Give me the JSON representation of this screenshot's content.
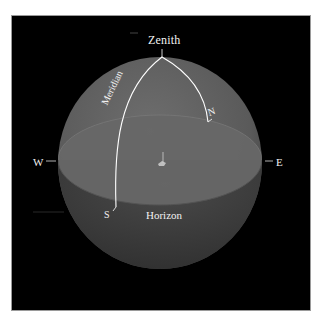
{
  "diagram": {
    "type": "celestial-sphere",
    "labels": {
      "zenith": "Zenith",
      "meridian": "Meridian",
      "north": "N",
      "south": "S",
      "east": "E",
      "west": "W",
      "horizon": "Horizon"
    },
    "colors": {
      "background": "#000000",
      "frame": "#ffffff",
      "sphere_upper": "#5e5e5e",
      "sphere_lower": "#3a3a3a",
      "horizon_plane": "#6b6b6b",
      "meridian_line": "#ffffff",
      "label_text": "#f2f2f2"
    }
  }
}
